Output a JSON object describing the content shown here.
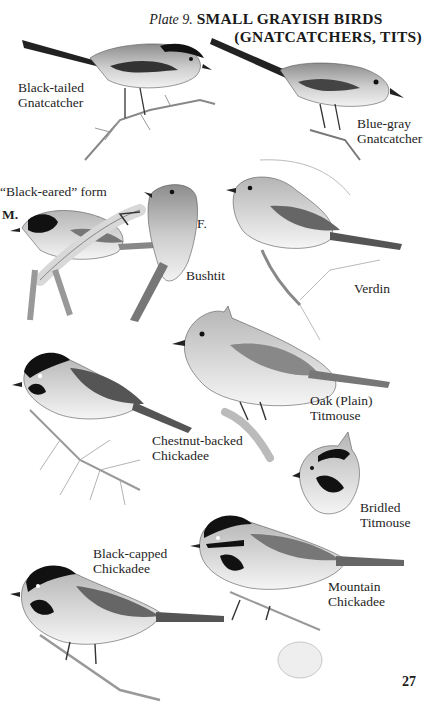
{
  "header": {
    "plate_label": "Plate 9.",
    "title_line1": "SMALL GRAYISH BIRDS",
    "title_line2": "(GNATCATCHERS, TITS)"
  },
  "birds": [
    {
      "id": "black-tailed-gnatcatcher",
      "label_line1": "Black-tailed",
      "label_line2": "Gnatcatcher"
    },
    {
      "id": "blue-gray-gnatcatcher",
      "label_line1": "Blue-gray",
      "label_line2": "Gnatcatcher"
    },
    {
      "id": "bushtit",
      "label_line1": "Bushtit",
      "form_label": "“Black-eared” form",
      "male_label": "M.",
      "female_label": "F."
    },
    {
      "id": "verdin",
      "label_line1": "Verdin"
    },
    {
      "id": "oak-titmouse",
      "label_line1": "Oak (Plain)",
      "label_line2": "Titmouse"
    },
    {
      "id": "chestnut-backed-chickadee",
      "label_line1": "Chestnut-backed",
      "label_line2": "Chickadee"
    },
    {
      "id": "bridled-titmouse",
      "label_line1": "Bridled",
      "label_line2": "Titmouse"
    },
    {
      "id": "black-capped-chickadee",
      "label_line1": "Black-capped",
      "label_line2": "Chickadee"
    },
    {
      "id": "mountain-chickadee",
      "label_line1": "Mountain",
      "label_line2": "Chickadee"
    }
  ],
  "page_number": "27",
  "colors": {
    "ink": "#1a1a1a",
    "bird_gray": "#9a9a9a",
    "bird_light": "#e6e6e6",
    "paper": "#ffffff"
  }
}
